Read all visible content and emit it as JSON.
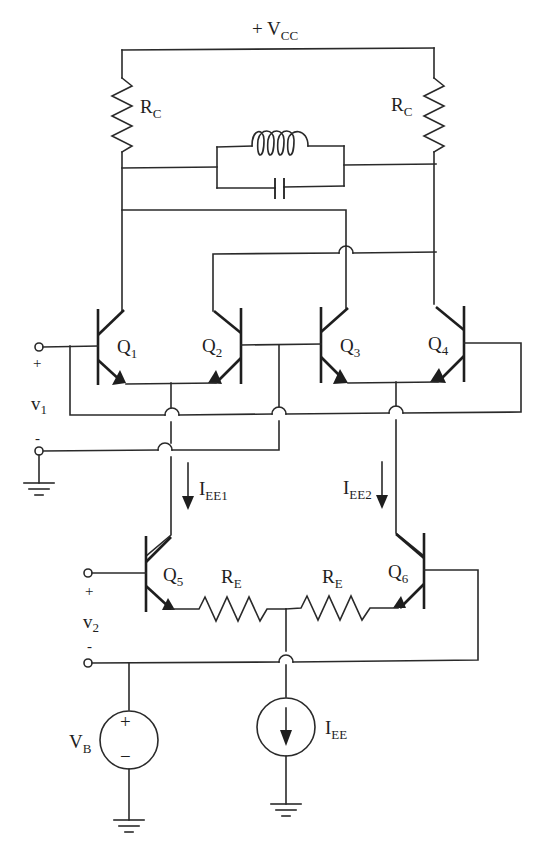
{
  "diagram": {
    "type": "circuit-schematic",
    "supply": {
      "label": "+ V",
      "sub": "CC"
    },
    "resistors": {
      "rc_left": {
        "label": "R",
        "sub": "C"
      },
      "rc_right": {
        "label": "R",
        "sub": "C"
      },
      "re_left": {
        "label": "R",
        "sub": "E"
      },
      "re_right": {
        "label": "R",
        "sub": "E"
      }
    },
    "tank": {
      "components": [
        "inductor",
        "capacitor"
      ],
      "connection": "parallel"
    },
    "transistors": [
      {
        "id": "Q1",
        "label": "Q",
        "sub": "1"
      },
      {
        "id": "Q2",
        "label": "Q",
        "sub": "2"
      },
      {
        "id": "Q3",
        "label": "Q",
        "sub": "3"
      },
      {
        "id": "Q4",
        "label": "Q",
        "sub": "4"
      },
      {
        "id": "Q5",
        "label": "Q",
        "sub": "5"
      },
      {
        "id": "Q6",
        "label": "Q",
        "sub": "6"
      }
    ],
    "currents": {
      "iee1": {
        "label": "I",
        "sub": "EE1"
      },
      "iee2": {
        "label": "I",
        "sub": "EE2"
      },
      "iee": {
        "label": "I",
        "sub": "EE"
      }
    },
    "inputs": {
      "v1": {
        "label": "v",
        "sub": "1",
        "plus": "+",
        "minus": "-"
      },
      "v2": {
        "label": "v",
        "sub": "2",
        "plus": "+",
        "minus": "-"
      }
    },
    "sources": {
      "vb": {
        "label": "V",
        "sub": "B",
        "plus": "+",
        "minus": "−"
      }
    }
  }
}
